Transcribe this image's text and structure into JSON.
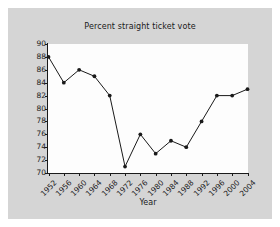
{
  "chart_data": {
    "type": "line",
    "title": "Percent straight ticket vote",
    "xlabel": "Year",
    "ylabel": "",
    "x": [
      1952,
      1956,
      1960,
      1964,
      1968,
      1972,
      1976,
      1980,
      1984,
      1988,
      1992,
      1996,
      2000,
      2004
    ],
    "values": [
      88,
      84,
      86,
      85,
      82,
      71,
      76,
      73,
      75,
      74,
      78,
      82,
      82,
      83
    ],
    "categories": [
      "1952",
      "1956",
      "1960",
      "1964",
      "1968",
      "1972",
      "1976",
      "1980",
      "1984",
      "1988",
      "1992",
      "1996",
      "2000",
      "2004"
    ],
    "xtick_labels": [
      "1952",
      "1956",
      "1960",
      "1964",
      "1968",
      "1972",
      "1976",
      "1980",
      "1984",
      "1988",
      "1992",
      "1996",
      "2000",
      "2004"
    ],
    "ytick_labels": [
      "90",
      "88",
      "86",
      "84",
      "82",
      "80",
      "78",
      "76",
      "74",
      "72",
      "70"
    ],
    "yticks": [
      90,
      88,
      86,
      84,
      82,
      80,
      78,
      76,
      74,
      72,
      70
    ],
    "ylim": [
      70,
      90
    ],
    "xlim": [
      1952,
      2004
    ],
    "grid": false,
    "legend": null,
    "marker": "filled-circle",
    "line_color": "#1a1a1a",
    "marker_color": "#1a1a1a",
    "plot_background": "#fdfdfd",
    "figure_background": "#d5d5d5"
  }
}
